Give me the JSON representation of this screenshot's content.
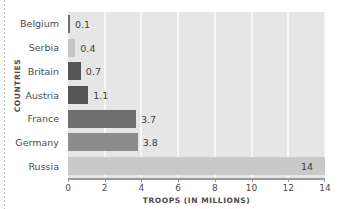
{
  "chart_data": {
    "type": "bar",
    "orientation": "horizontal",
    "title": "",
    "xlabel": "TROOPS (IN MILLIONS)",
    "ylabel": "COUNTRIES",
    "categories": [
      "Belgium",
      "Serbia",
      "Britain",
      "Austria",
      "France",
      "Germany",
      "Russia"
    ],
    "values": [
      0.1,
      0.4,
      0.7,
      1.1,
      3.7,
      3.8,
      14
    ],
    "value_labels": [
      "0.1",
      "0.4",
      "0.7",
      "1.1",
      "3.7",
      "3.8",
      "14"
    ],
    "bar_colors": [
      "#6e6e6e",
      "#c6c6c6",
      "#565656",
      "#565656",
      "#6e6e6e",
      "#8c8c8c",
      "#c9c9c9"
    ],
    "label_placement": [
      "outside",
      "outside",
      "outside",
      "outside",
      "outside",
      "outside",
      "inside"
    ],
    "xlim": [
      0,
      14
    ],
    "xticks": [
      0,
      2,
      4,
      6,
      8,
      10,
      12,
      14
    ],
    "xtick_labels": [
      "0",
      "2",
      "4",
      "6",
      "8",
      "10",
      "12",
      "14"
    ],
    "grid": "vertical-white-on-gray",
    "legend": "none",
    "plot_background": "#e6e6e6",
    "gridline_color": "#f7f7f7",
    "axis_color": "#9a9a9a",
    "text_color": "#4d4d4d"
  }
}
